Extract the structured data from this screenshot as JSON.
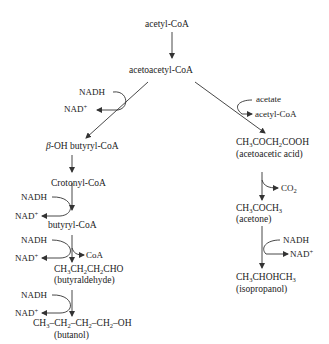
{
  "diagram": {
    "top": {
      "acetyl_coa": "acetyl-CoA",
      "acetoacetyl_coa": "acetoacetyl-CoA"
    },
    "left_branch": {
      "nadh_1": "NADH",
      "nad_1": "NAD",
      "beta_oh_prefix": "β",
      "beta_oh_rest": "-OH butyryl-CoA",
      "crotonyl_coa": "Crotonyl-CoA",
      "nadh_2": "NADH",
      "nad_2": "NAD",
      "butyryl_coa": "butyryl-CoA",
      "nadh_3": "NADH",
      "nad_3": "NAD",
      "coa_out": "CoA",
      "butyraldehyde_formula": "CH3CH2CH2CHO",
      "butyraldehyde_name": "(butyraldehyde)",
      "nadh_4": "NADH",
      "nad_4": "NAD",
      "butanol_formula": "CH3–CH2–CH2–CH2–OH",
      "butanol_name": "(butanol)"
    },
    "right_branch": {
      "acetate": "acetate",
      "acetyl_coa_out": "acetyl-CoA",
      "acetoacetic_formula": "CH3COCH2COOH",
      "acetoacetic_name": "(acetoacetic acid)",
      "co2": "CO2",
      "acetone_formula": "CH3COCH3",
      "acetone_name": "(acetone)",
      "nadh": "NADH",
      "nad": "NAD",
      "isopropanol_formula": "CH3CHOHCH3",
      "isopropanol_name": "(isopropanol)"
    },
    "plus_sign": "+",
    "colors": {
      "text": "#222222",
      "arrow": "#333333",
      "background": "#ffffff"
    }
  }
}
